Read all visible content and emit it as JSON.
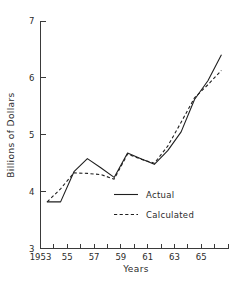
{
  "chart_data": {
    "type": "line",
    "title": "",
    "xlabel": "Years",
    "ylabel": "Billions of Dollars",
    "xlim": [
      1953,
      1967
    ],
    "ylim": [
      3,
      7
    ],
    "grid": false,
    "legend_position": "center-right-inside",
    "x_tick_labels": [
      "1953",
      "55",
      "57",
      "59",
      "61",
      "63",
      "65"
    ],
    "x_tick_values": [
      1953,
      1955,
      1957,
      1959,
      1961,
      1963,
      1965
    ],
    "x_minor_tick_values": [
      1954,
      1956,
      1958,
      1960,
      1962,
      1964,
      1966,
      1967
    ],
    "y_tick_labels": [
      "3",
      "4",
      "5",
      "6",
      "7"
    ],
    "y_tick_values": [
      3,
      4,
      5,
      6,
      7
    ],
    "x": [
      1953.5,
      1954.5,
      1955.5,
      1956.5,
      1957.5,
      1958.5,
      1959.5,
      1960.5,
      1961.5,
      1962.5,
      1963.5,
      1964.5,
      1965.5,
      1966.5
    ],
    "series": [
      {
        "name": "Actual",
        "style": "solid",
        "values": [
          3.82,
          3.82,
          4.35,
          4.58,
          4.42,
          4.25,
          4.68,
          4.58,
          4.48,
          4.72,
          5.05,
          5.62,
          5.95,
          6.4
        ]
      },
      {
        "name": "Calculated",
        "style": "dashed",
        "values": [
          3.82,
          4.05,
          4.33,
          4.32,
          4.3,
          4.22,
          4.66,
          4.57,
          4.5,
          4.8,
          5.22,
          5.65,
          5.88,
          6.13
        ]
      }
    ],
    "colors": {
      "actual": "#1f1f1f",
      "calculated": "#1f1f1f",
      "axis": "#3a3a3a",
      "background": "#ffffff"
    }
  },
  "legend": {
    "entries": [
      {
        "label": "Actual"
      },
      {
        "label": "Calculated"
      }
    ]
  },
  "axes": {
    "x_title": "Years",
    "y_title": "Billions of Dollars"
  }
}
